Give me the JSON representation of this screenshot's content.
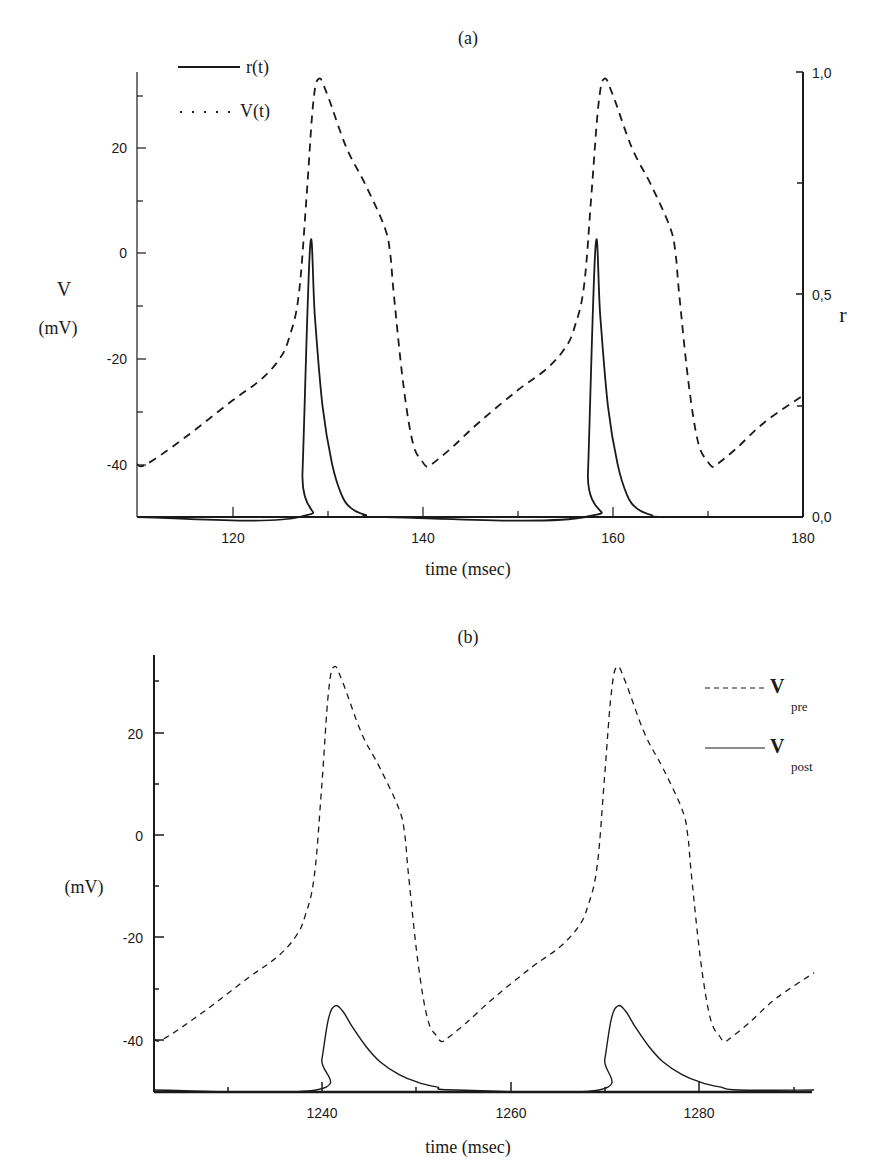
{
  "chart_data": [
    {
      "panel": "(a)",
      "type": "line",
      "title": "(a)",
      "xlabel": "time (msec)",
      "ylabel": "V (mV)",
      "ylabel_right": "r",
      "xlim": [
        110,
        180
      ],
      "ylim": [
        -50,
        34
      ],
      "ylim_right": [
        0.0,
        1.0
      ],
      "x_ticks": [
        120,
        140,
        160,
        180
      ],
      "y_ticks": [
        20,
        0,
        -20,
        -40
      ],
      "y_ticks_right": [
        "1,0",
        "0,5",
        "0,0"
      ],
      "grid": false,
      "legend_position": "upper-left",
      "legend": [
        {
          "label": "r(t)",
          "style": "solid"
        },
        {
          "label": "V(t)",
          "style": "dotted"
        }
      ],
      "series": [
        {
          "name": "V(t)",
          "axis": "left",
          "style": "dashed",
          "x": [
            110,
            111,
            115,
            120,
            123,
            125,
            126,
            127,
            127.8,
            128.5,
            129.1,
            130,
            132,
            134,
            136,
            136.6,
            137,
            138,
            139,
            140,
            140.5,
            141,
            143,
            146,
            150,
            153,
            155,
            156,
            157,
            157.8,
            158.5,
            159.1,
            160,
            162,
            164,
            166,
            166.6,
            167,
            168,
            169,
            170,
            170.5,
            171,
            173,
            176,
            180
          ],
          "y": [
            -40,
            -40,
            -35,
            -28,
            -24,
            -20,
            -16,
            -8,
            10,
            28,
            33,
            30,
            20,
            13,
            5,
            0,
            -8,
            -25,
            -36,
            -39.5,
            -40.5,
            -40,
            -37,
            -32,
            -26,
            -22,
            -18,
            -14,
            -6,
            12,
            28,
            33,
            30,
            20,
            13,
            5,
            0,
            -8,
            -25,
            -36,
            -39.5,
            -40.5,
            -40,
            -37,
            -32,
            -27
          ]
        },
        {
          "name": "r(t)",
          "axis": "right",
          "style": "solid",
          "x": [
            110,
            127.1,
            127.4,
            128.2,
            128.7,
            129.5,
            130.5,
            131.5,
            132.5,
            134,
            136,
            180
          ],
          "y_note": "r values on right axis 0–1",
          "y": [
            0,
            0,
            0.1,
            0.61,
            0.45,
            0.25,
            0.12,
            0.05,
            0.02,
            0.005,
            0,
            0
          ],
          "second_pulse_shift_ms": 30
        }
      ]
    },
    {
      "panel": "(b)",
      "type": "line",
      "title": "(b)",
      "xlabel": "time (msec)",
      "ylabel": "(mV)",
      "xlim": [
        1222,
        1292
      ],
      "ylim": [
        -50,
        34
      ],
      "x_ticks": [
        1240,
        1260,
        1280
      ],
      "y_ticks": [
        20,
        0,
        -20,
        -40
      ],
      "grid": false,
      "legend_position": "upper-right",
      "legend": [
        {
          "label": "V",
          "subscript": "pre",
          "style": "dashed"
        },
        {
          "label": "V",
          "subscript": "post",
          "style": "solid"
        }
      ],
      "series": [
        {
          "name": "V_pre",
          "style": "dashed",
          "x": [
            1222,
            1223,
            1227,
            1232,
            1235,
            1237,
            1238,
            1239,
            1239.8,
            1240.5,
            1241.1,
            1242,
            1244,
            1246,
            1248,
            1248.6,
            1249,
            1250,
            1251,
            1252,
            1252.5,
            1253,
            1255,
            1258,
            1262,
            1265,
            1267,
            1268,
            1269,
            1269.8,
            1270.5,
            1271.1,
            1272,
            1274,
            1276,
            1278,
            1278.6,
            1279,
            1280,
            1281,
            1282,
            1282.5,
            1283,
            1285,
            1288,
            1292
          ],
          "y": [
            -40,
            -40,
            -35,
            -28,
            -24,
            -20,
            -16,
            -8,
            10,
            28,
            33,
            30,
            20,
            13,
            5,
            0,
            -8,
            -25,
            -36,
            -39.5,
            -40.5,
            -40,
            -37,
            -32,
            -26,
            -22,
            -18,
            -14,
            -6,
            12,
            28,
            33,
            30,
            20,
            13,
            5,
            0,
            -8,
            -25,
            -36,
            -39.5,
            -40.5,
            -40,
            -37,
            -32,
            -27
          ]
        },
        {
          "name": "V_post",
          "style": "solid",
          "x": [
            1222,
            1239.2,
            1239.8,
            1240.5,
            1241.2,
            1242,
            1243,
            1244.5,
            1246,
            1248,
            1250,
            1252,
            1254,
            1292
          ],
          "y": [
            -50,
            -50,
            -44,
            -36,
            -33.5,
            -34.5,
            -37.5,
            -41.5,
            -44.5,
            -47,
            -48.5,
            -49.4,
            -50,
            -50
          ],
          "second_pulse_shift_ms": 30
        }
      ]
    }
  ],
  "labels": {
    "panel_a_title": "(a)",
    "panel_b_title": "(b)",
    "a_ylabel_v": "V",
    "a_ylabel_unit": "(mV)",
    "a_ylabel_right": "r",
    "a_xlabel": "time (msec)",
    "b_ylabel": "(mV)",
    "b_xlabel": "time (msec)",
    "a_legend_r": "r(t)",
    "a_legend_v": "V(t)",
    "a_legend_dots": ". . . . .",
    "b_legend_pre_main": "V",
    "b_legend_pre_sub": "pre",
    "b_legend_post_main": "V",
    "b_legend_post_sub": "post",
    "a_xticks": [
      "120",
      "140",
      "160",
      "180"
    ],
    "a_yticks": [
      "20",
      "0",
      "-20",
      "-40"
    ],
    "a_rticks": [
      "1,0",
      "0,5",
      "0,0"
    ],
    "b_xticks": [
      "1240",
      "1260",
      "1280"
    ],
    "b_yticks": [
      "20",
      "0",
      "-20",
      "-40"
    ]
  }
}
